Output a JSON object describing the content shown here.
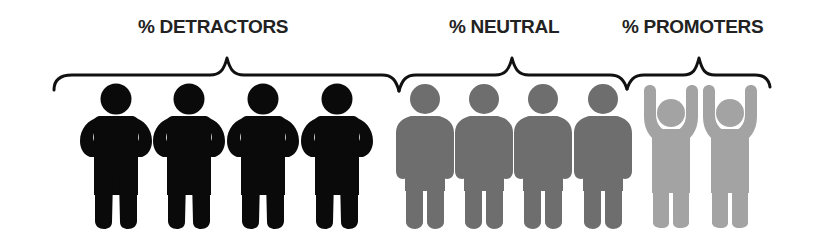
{
  "diagram": {
    "type": "nps-segments",
    "groups": [
      {
        "id": "detractors",
        "label": "% DETRACTORS",
        "figure_count": 4,
        "pose": "hands-on-hips",
        "color": "#0a0a0a"
      },
      {
        "id": "neutral",
        "label": "% NEUTRAL",
        "figure_count": 4,
        "pose": "holding-hands",
        "color": "#6e6e6e"
      },
      {
        "id": "promoters",
        "label": "% PROMOTERS",
        "figure_count": 2,
        "pose": "arms-raised",
        "color": "#a3a3a3"
      }
    ],
    "bracket_color": "#111111",
    "label_color": "#222222"
  }
}
